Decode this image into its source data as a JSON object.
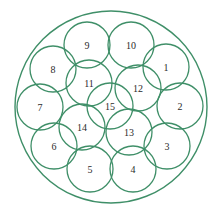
{
  "diagram": {
    "type": "circle-packing",
    "stroke_color": "#3f8f68",
    "text_color": "#2b2b2b",
    "outer_circle": {
      "cx": 111,
      "cy": 107,
      "r": 96
    },
    "inner_radius": 23,
    "circles": [
      {
        "label": "1",
        "cx": 166,
        "cy": 67
      },
      {
        "label": "2",
        "cx": 180,
        "cy": 106
      },
      {
        "label": "3",
        "cx": 167,
        "cy": 146
      },
      {
        "label": "4",
        "cx": 133,
        "cy": 169
      },
      {
        "label": "5",
        "cx": 90,
        "cy": 169
      },
      {
        "label": "6",
        "cx": 54,
        "cy": 146
      },
      {
        "label": "7",
        "cx": 40,
        "cy": 107
      },
      {
        "label": "8",
        "cx": 53,
        "cy": 69
      },
      {
        "label": "9",
        "cx": 87,
        "cy": 45
      },
      {
        "label": "10",
        "cx": 131,
        "cy": 45
      },
      {
        "label": "11",
        "cx": 89,
        "cy": 83
      },
      {
        "label": "12",
        "cx": 138,
        "cy": 88
      },
      {
        "label": "13",
        "cx": 129,
        "cy": 132
      },
      {
        "label": "14",
        "cx": 82,
        "cy": 127
      },
      {
        "label": "15",
        "cx": 110,
        "cy": 106
      }
    ]
  }
}
